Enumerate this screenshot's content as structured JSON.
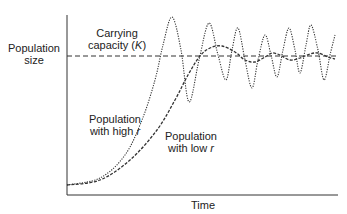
{
  "chart_data": {
    "type": "line",
    "title": "",
    "xlabel": "Time",
    "ylabel": "Population size",
    "grid": false,
    "legend": "none (curves labelled inline)",
    "reference_lines": [
      {
        "name": "Carrying capacity (K)",
        "style": "dashed",
        "y_pixel": 56
      }
    ],
    "series": [
      {
        "name": "Population with high r",
        "style": "dotted",
        "description": "Rapid exponential growth overshooting K, then sustained large oscillations around K",
        "points_px": [
          [
            67,
            185
          ],
          [
            100,
            178
          ],
          [
            125,
            155
          ],
          [
            142,
            120
          ],
          [
            155,
            80
          ],
          [
            163,
            45
          ],
          [
            172,
            17
          ],
          [
            181,
            50
          ],
          [
            189,
            102
          ],
          [
            199,
            60
          ],
          [
            209,
            23
          ],
          [
            218,
            55
          ],
          [
            226,
            80
          ],
          [
            232,
            50
          ],
          [
            238,
            28
          ],
          [
            245,
            60
          ],
          [
            252,
            88
          ],
          [
            258,
            60
          ],
          [
            265,
            35
          ],
          [
            271,
            55
          ],
          [
            277,
            77
          ],
          [
            283,
            50
          ],
          [
            289,
            28
          ],
          [
            295,
            50
          ],
          [
            300,
            73
          ],
          [
            306,
            45
          ],
          [
            311,
            25
          ],
          [
            318,
            50
          ],
          [
            324,
            80
          ],
          [
            330,
            55
          ],
          [
            335,
            35
          ]
        ]
      },
      {
        "name": "Population with low r",
        "style": "dashed",
        "description": "Slower S-shaped (logistic) growth, slight overshoot and damped oscillations converging on K",
        "points_px": [
          [
            67,
            185
          ],
          [
            100,
            180
          ],
          [
            130,
            160
          ],
          [
            157,
            130
          ],
          [
            175,
            100
          ],
          [
            188,
            75
          ],
          [
            200,
            56
          ],
          [
            210,
            48
          ],
          [
            222,
            46
          ],
          [
            235,
            52
          ],
          [
            245,
            60
          ],
          [
            255,
            62
          ],
          [
            265,
            57
          ],
          [
            272,
            53
          ],
          [
            280,
            55
          ],
          [
            290,
            60
          ],
          [
            300,
            58
          ],
          [
            310,
            54
          ],
          [
            318,
            53
          ],
          [
            328,
            57
          ],
          [
            335,
            59
          ]
        ]
      }
    ],
    "axes": {
      "x_axis_y_px": 195,
      "y_axis_x_px": 67,
      "x_end_px": 338,
      "y_top_px": 15
    }
  },
  "labels": {
    "ylabel_line1": "Population",
    "ylabel_line2": "size",
    "xlabel": "Time",
    "k_line1": "Carrying",
    "k_line2_prefix": "capacity (",
    "k_symbol": "K",
    "k_line2_suffix": ")",
    "high_line1": "Population",
    "high_line2_prefix": "with high ",
    "high_symbol": "r",
    "low_line1": "Population",
    "low_line2_prefix": "with low ",
    "low_symbol": "r"
  }
}
